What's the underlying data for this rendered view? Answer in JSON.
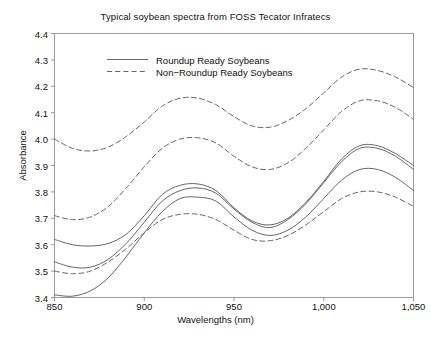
{
  "chart_data": {
    "type": "line",
    "title": "Typical soybean spectra from FOSS Tecator Infratecs",
    "xlabel": "Wavelengths (nm)",
    "ylabel": "Absorbance",
    "xlim": [
      850,
      1050
    ],
    "ylim": [
      3.4,
      4.4
    ],
    "grid": false,
    "legend_position": "top-center",
    "xticks": [
      850,
      900,
      950,
      1000,
      1050
    ],
    "xtick_labels": [
      "850",
      "900",
      "950",
      "1,000",
      "1,050"
    ],
    "yticks": [
      3.4,
      3.5,
      3.6,
      3.7,
      3.8,
      3.9,
      4.0,
      4.1,
      4.2,
      4.3,
      4.4
    ],
    "ytick_labels": [
      "3.4",
      "3.5",
      "3.6",
      "3.7",
      "3.8",
      "3.9",
      "4.0",
      "4.1",
      "4.2",
      "4.3",
      "4.4"
    ],
    "line_color": "#555555",
    "x": [
      850,
      860,
      870,
      880,
      890,
      900,
      910,
      920,
      930,
      940,
      950,
      960,
      970,
      980,
      990,
      1000,
      1010,
      1020,
      1030,
      1040,
      1050
    ],
    "series": [
      {
        "name": "Roundup Ready Soybeans",
        "style": "solid",
        "values": [
          3.62,
          3.6,
          3.595,
          3.605,
          3.64,
          3.71,
          3.79,
          3.825,
          3.83,
          3.805,
          3.74,
          3.69,
          3.675,
          3.7,
          3.76,
          3.84,
          3.925,
          3.975,
          3.975,
          3.945,
          3.9
        ]
      },
      {
        "name": "Roundup Ready Soybeans",
        "style": "solid",
        "values": [
          3.535,
          3.515,
          3.515,
          3.545,
          3.605,
          3.685,
          3.765,
          3.805,
          3.815,
          3.795,
          3.735,
          3.685,
          3.665,
          3.695,
          3.755,
          3.835,
          3.915,
          3.965,
          3.965,
          3.935,
          3.885
        ]
      },
      {
        "name": "Roundup Ready Soybeans",
        "style": "solid",
        "values": [
          3.41,
          3.405,
          3.425,
          3.475,
          3.555,
          3.645,
          3.725,
          3.775,
          3.78,
          3.765,
          3.705,
          3.655,
          3.635,
          3.655,
          3.705,
          3.775,
          3.845,
          3.885,
          3.885,
          3.855,
          3.805
        ]
      },
      {
        "name": "Non-Roundup Ready Soybeans",
        "style": "dashed",
        "values": [
          4.0,
          3.965,
          3.955,
          3.97,
          4.01,
          4.065,
          4.125,
          4.155,
          4.155,
          4.13,
          4.085,
          4.05,
          4.045,
          4.07,
          4.115,
          4.175,
          4.235,
          4.265,
          4.26,
          4.235,
          4.195
        ]
      },
      {
        "name": "Non-Roundup Ready Soybeans",
        "style": "dashed",
        "values": [
          3.71,
          3.695,
          3.705,
          3.745,
          3.815,
          3.895,
          3.965,
          4.0,
          4.005,
          3.985,
          3.935,
          3.895,
          3.885,
          3.91,
          3.965,
          4.035,
          4.105,
          4.145,
          4.145,
          4.12,
          4.075
        ]
      },
      {
        "name": "Non-Roundup Ready Soybeans",
        "style": "dashed",
        "values": [
          3.5,
          3.49,
          3.5,
          3.535,
          3.585,
          3.645,
          3.695,
          3.715,
          3.715,
          3.695,
          3.655,
          3.62,
          3.615,
          3.635,
          3.675,
          3.725,
          3.775,
          3.8,
          3.8,
          3.78,
          3.745
        ]
      }
    ],
    "legend": [
      {
        "label": "Roundup Ready Soybeans",
        "style": "solid"
      },
      {
        "label": "Non−Roundup Ready Soybeans",
        "style": "dashed"
      }
    ]
  }
}
